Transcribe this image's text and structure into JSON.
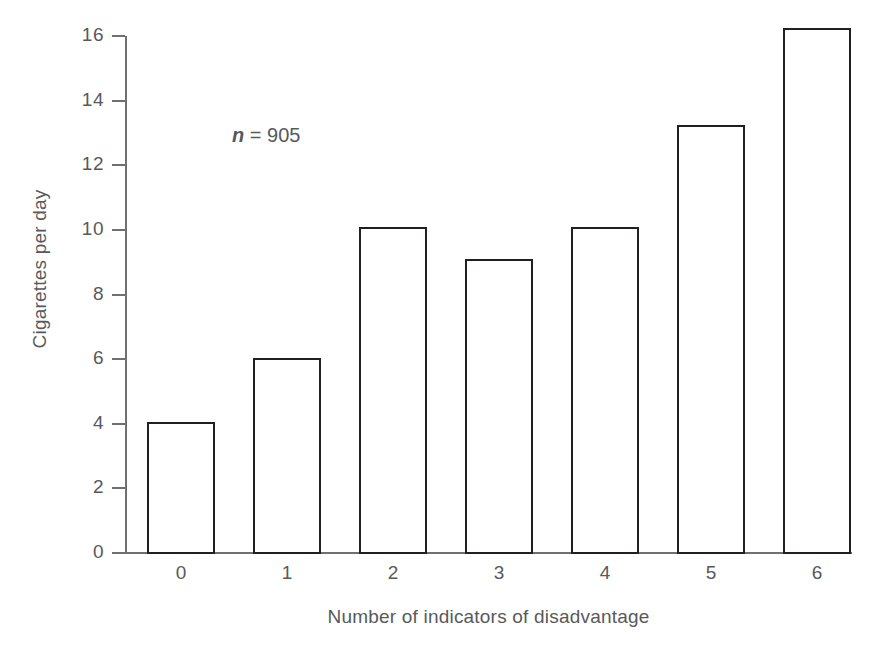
{
  "chart_data": {
    "type": "bar",
    "title": "",
    "subtitle": "",
    "xlabel": "Number of indicators of disadvantage",
    "ylabel": "Cigarettes per day",
    "categories": [
      "0",
      "1",
      "2",
      "3",
      "4",
      "5",
      "6"
    ],
    "values": [
      4.05,
      6.05,
      10.1,
      9.1,
      10.1,
      13.25,
      16.25
    ],
    "series": [
      {
        "name": "Cigarettes per day",
        "values": [
          4.05,
          6.05,
          10.1,
          9.1,
          10.1,
          13.25,
          16.25
        ]
      }
    ],
    "ylim": [
      0,
      16
    ],
    "yticks": [
      0,
      2,
      4,
      6,
      8,
      10,
      12,
      14,
      16
    ],
    "ytick_labels": [
      "0",
      "2",
      "4",
      "6",
      "8",
      "10",
      "12",
      "14",
      "16"
    ],
    "xtick_labels": [
      "0",
      "1",
      "2",
      "3",
      "4",
      "5",
      "6"
    ],
    "grid": false,
    "legend": false,
    "legend_position": "none",
    "annotations": [
      {
        "name": "sample-size",
        "variable": "n",
        "separator": " = ",
        "value": "905",
        "text": "n = 905"
      }
    ],
    "colors": {
      "bar_fill": "#ffffff",
      "bar_edge": "#231f20",
      "axis": "#6f7072",
      "text": "#58595b",
      "background": "#ffffff"
    }
  }
}
